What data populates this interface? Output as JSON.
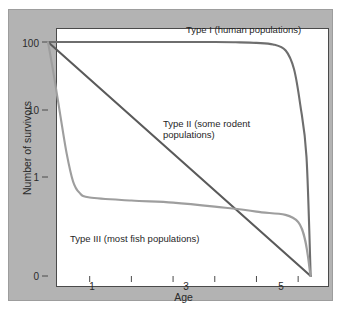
{
  "figure": {
    "title": "",
    "background_color": "#b3b3b3",
    "plot_background_color": "#ffffff"
  },
  "axes": {
    "xlabel": "Age",
    "ylabel": "Number of survivors",
    "y_ticks": [
      "100",
      "10",
      "1",
      "0"
    ],
    "x_ticks": [
      "",
      "1",
      "",
      "3",
      "",
      "5",
      ""
    ]
  },
  "annotations": {
    "type1": "Type I (human populations)",
    "type2": "Type II (some rodent\npopulations)",
    "type3": "Type III (most fish populations)"
  },
  "chart_data": {
    "type": "line",
    "title": "",
    "xlabel": "Age",
    "ylabel": "Number of survivors",
    "xlim": [
      0,
      6.5
    ],
    "ylim": [
      0,
      100
    ],
    "yscale": "log-like (100, 10, 1, 0)",
    "grid": false,
    "legend": "inline annotations",
    "y_tick_values": [
      100,
      10,
      1,
      0
    ],
    "x_tick_values": [
      0,
      1,
      2,
      3,
      4,
      5,
      6
    ],
    "series": [
      {
        "name": "Type I (human populations)",
        "color": "#6e6e6e",
        "description": "Flat near 100 survivors until late life, then drops abruptly to 0",
        "x": [
          0,
          1,
          2,
          3,
          4,
          4.5,
          5,
          5.4,
          5.7,
          5.9,
          6.05,
          6.2,
          6.3
        ],
        "y": [
          100,
          100,
          100,
          100,
          100,
          99,
          97,
          92,
          75,
          40,
          12,
          2,
          0
        ]
      },
      {
        "name": "Type II (some rodent populations)",
        "color": "#5a5a5a",
        "description": "Constant proportional mortality; straight line on log axis from 100 to 0",
        "x": [
          0,
          1,
          2,
          3,
          4,
          5,
          6,
          6.3
        ],
        "y": [
          100,
          45,
          20,
          9,
          4,
          1.6,
          0.4,
          0
        ]
      },
      {
        "name": "Type III (most fish populations)",
        "color": "#9e9e9e",
        "description": "Very high early mortality, then a long flat tail of few survivors",
        "x": [
          0,
          0.15,
          0.3,
          0.45,
          0.6,
          0.75,
          1,
          2,
          3,
          4,
          5,
          6,
          6.3
        ],
        "y": [
          100,
          30,
          8,
          2.2,
          0.8,
          0.45,
          0.35,
          0.3,
          0.27,
          0.22,
          0.17,
          0.1,
          0
        ]
      }
    ]
  }
}
